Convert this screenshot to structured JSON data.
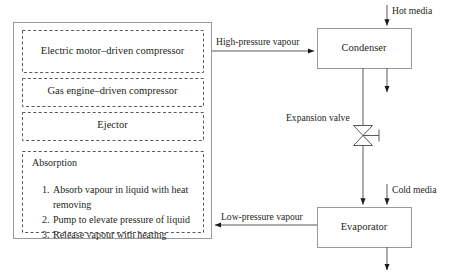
{
  "diagram": {
    "colors": {
      "stroke": "#808080",
      "dashed_stroke": "#595959",
      "line": "#595959",
      "text": "#231f20",
      "background": "#ffffff"
    },
    "compressor_group": {
      "name": "compression-stage-group",
      "options": [
        {
          "label": "Electric motor–driven compressor"
        },
        {
          "label": "Gas engine–driven compressor"
        },
        {
          "label": "Ejector"
        }
      ],
      "absorption": {
        "title": "Absorption",
        "steps": [
          {
            "num": "1.",
            "text": "Absorb vapour in liquid with heat"
          },
          {
            "num": "",
            "text": "removing",
            "continuation": true
          },
          {
            "num": "2.",
            "text": "Pump to elevate pressure of liquid"
          },
          {
            "num": "3.",
            "text": "Release vapour with heating"
          }
        ]
      }
    },
    "nodes": [
      {
        "id": "condenser",
        "label": "Condenser"
      },
      {
        "id": "evaporator",
        "label": "Evaporator"
      }
    ],
    "valve": {
      "label": "Expansion valve",
      "symbol": "butterfly-valve"
    },
    "flows": [
      {
        "id": "high-pressure",
        "label": "High-pressure vapour",
        "direction": "right"
      },
      {
        "id": "low-pressure",
        "label": "Low-pressure vapour",
        "direction": "left"
      }
    ],
    "media": [
      {
        "id": "hot-media",
        "label": "Hot media"
      },
      {
        "id": "cold-media",
        "label": "Cold media"
      }
    ]
  }
}
